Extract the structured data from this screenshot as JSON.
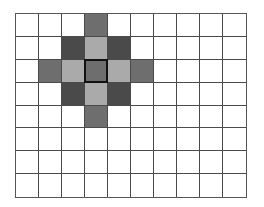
{
  "grid": {
    "columns": 10,
    "rows": 8,
    "colors": {
      "empty": "#ffffff",
      "dark": "#4a4a4a",
      "medium": "#6e6e6e",
      "light": "#aaaaaa"
    },
    "center": {
      "col": 3,
      "row": 2
    },
    "filled_cells": [
      {
        "col": 3,
        "row": 0,
        "shade": "medium"
      },
      {
        "col": 2,
        "row": 1,
        "shade": "dark"
      },
      {
        "col": 3,
        "row": 1,
        "shade": "light"
      },
      {
        "col": 4,
        "row": 1,
        "shade": "dark"
      },
      {
        "col": 1,
        "row": 2,
        "shade": "medium"
      },
      {
        "col": 2,
        "row": 2,
        "shade": "light"
      },
      {
        "col": 3,
        "row": 2,
        "shade": "medium"
      },
      {
        "col": 4,
        "row": 2,
        "shade": "light"
      },
      {
        "col": 5,
        "row": 2,
        "shade": "medium"
      },
      {
        "col": 2,
        "row": 3,
        "shade": "dark"
      },
      {
        "col": 3,
        "row": 3,
        "shade": "light"
      },
      {
        "col": 4,
        "row": 3,
        "shade": "dark"
      },
      {
        "col": 3,
        "row": 4,
        "shade": "medium"
      }
    ]
  }
}
